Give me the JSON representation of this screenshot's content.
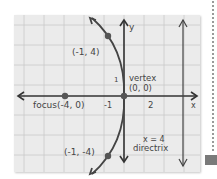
{
  "diagram": {
    "type": "parabola-graph",
    "axes": {
      "x_label": "x",
      "y_label": "y"
    },
    "tick_labels": {
      "x_neg": "-1",
      "x_pos": "2",
      "y_pos": "1"
    },
    "points": [
      {
        "label": "(-1, 4)",
        "x": -1,
        "y": 4
      },
      {
        "label": "(-1, -4)",
        "x": -1,
        "y": -4
      },
      {
        "label": "focus(-4, 0)",
        "x": -4,
        "y": 0
      }
    ],
    "vertex": {
      "label_line1": "vertex",
      "label_line2": "(0, 0)"
    },
    "directrix": {
      "label_line1": "x = 4",
      "label_line2": "directrix"
    },
    "colors": {
      "paper": "#ebebeb",
      "grid": "#c9c9c9",
      "ink": "#333333",
      "point": "#555555"
    }
  }
}
